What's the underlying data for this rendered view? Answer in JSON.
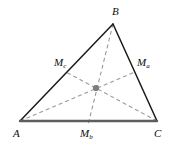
{
  "figure": {
    "background_color": "#ffffff",
    "vertex_labels": {
      "a": "A",
      "b": "B",
      "c": "C"
    },
    "midpoint_labels": {
      "ma_main": "M",
      "ma_sub": "a",
      "mb_main": "M",
      "mb_sub": "b",
      "mc_main": "M",
      "mc_sub": "c"
    },
    "colors": {
      "side_stroke": "#1a1a1a",
      "base_stroke": "#5e5e5e",
      "median_stroke": "#9a9a9a",
      "centroid_fill": "#7d7d7d",
      "label_color": "#0d0d0d"
    },
    "geometry": {
      "vertex_a": [
        20,
        121
      ],
      "vertex_b": [
        113,
        24
      ],
      "vertex_c": [
        157,
        121
      ],
      "midpoint_ma": [
        135,
        72
      ],
      "midpoint_mb": [
        88,
        121
      ],
      "midpoint_mc": [
        66,
        72
      ],
      "centroid": [
        96,
        88
      ]
    },
    "median_dash_pattern": "4 3"
  }
}
